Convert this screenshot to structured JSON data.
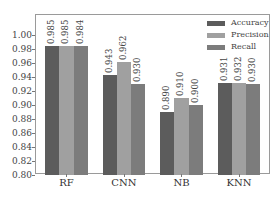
{
  "chart_data": {
    "type": "bar",
    "title": "",
    "xlabel": "",
    "ylabel": "",
    "categories": [
      "RF",
      "CNN",
      "NB",
      "KNN"
    ],
    "series": [
      {
        "name": "Accuracy",
        "color": "#5c5c5c",
        "values": [
          0.985,
          0.943,
          0.89,
          0.931
        ]
      },
      {
        "name": "Precision",
        "color": "#a0a0a0",
        "values": [
          0.985,
          0.962,
          0.91,
          0.932
        ]
      },
      {
        "name": "Recall",
        "color": "#7c7c7c",
        "values": [
          0.984,
          0.93,
          0.9,
          0.93
        ]
      }
    ],
    "value_labels": [
      [
        "0.985",
        "0.985",
        "0.984"
      ],
      [
        "0.943",
        "0.962",
        "0.930"
      ],
      [
        "0.890",
        "0.910",
        "0.900"
      ],
      [
        "0.931",
        "0.932",
        "0.930"
      ]
    ],
    "ylim": [
      0.8,
      1.02
    ],
    "yticks": [
      "0.80",
      "0.82",
      "0.84",
      "0.86",
      "0.88",
      "0.90",
      "0.92",
      "0.94",
      "0.96",
      "0.98",
      "1.00"
    ],
    "grid": false,
    "legend_position": "upper right",
    "legend": [
      "Accuracy",
      "Precision",
      "Recall"
    ]
  }
}
